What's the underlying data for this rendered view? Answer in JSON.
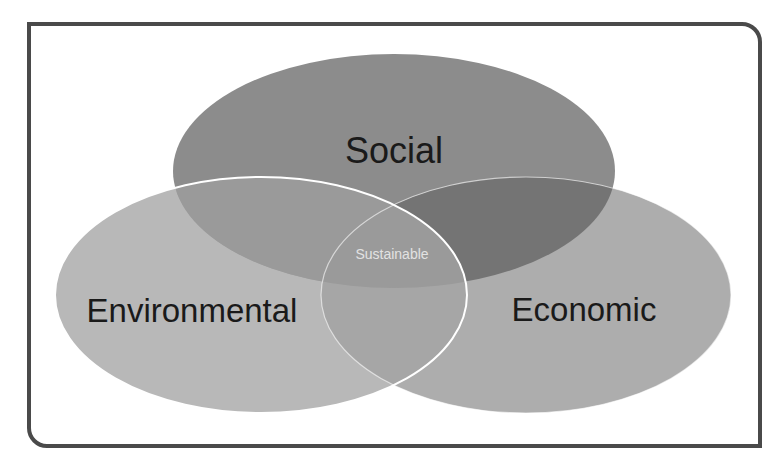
{
  "diagram": {
    "type": "venn",
    "sets": [
      {
        "id": "social",
        "label": "Social",
        "color": "#8c8c8c"
      },
      {
        "id": "environmental",
        "label": "Environmental",
        "color": "#b8b8b8"
      },
      {
        "id": "economic",
        "label": "Economic",
        "color": "#adadad"
      }
    ],
    "intersection": {
      "label": "Sustainable",
      "color": "#e2e2e2"
    },
    "frame_color": "#4a4a4a",
    "outline_color": "#ffffff"
  }
}
